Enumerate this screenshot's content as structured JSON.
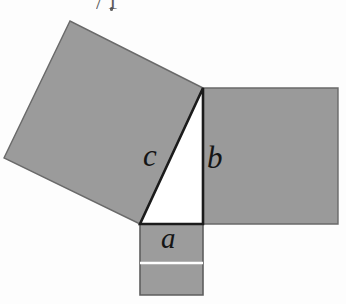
{
  "figure": {
    "background_color": "#fdfdfd",
    "square_fill": "#9b9b9b",
    "square_fill_right": "#9a9a9a",
    "square_fill_bottom": "#9c9c9c",
    "outline_color": "#4a4a4a",
    "triangle_fill": "#ffffff",
    "triangle_outline": "#1b1b1b",
    "divider_color": "#ffffff",
    "labels": {
      "hypotenuse": "c",
      "vertical_leg": "b",
      "horizontal_leg": "a"
    },
    "top_artifact": {
      "text": "/1",
      "visible": true
    },
    "geometry": {
      "triangle": {
        "apex": [
          203,
          88
        ],
        "bottom_left": [
          140,
          224
        ],
        "right_angle": [
          203,
          224
        ]
      },
      "square_c": [
        [
          203,
          88
        ],
        [
          70,
          21
        ],
        [
          4,
          158
        ],
        [
          140,
          224
        ]
      ],
      "square_b": [
        [
          203,
          88
        ],
        [
          338,
          88
        ],
        [
          338,
          224
        ],
        [
          203,
          224
        ]
      ],
      "square_a": [
        [
          140,
          224
        ],
        [
          203,
          224
        ],
        [
          203,
          295
        ],
        [
          140,
          295
        ]
      ],
      "square_a_divider_y": 263
    }
  }
}
